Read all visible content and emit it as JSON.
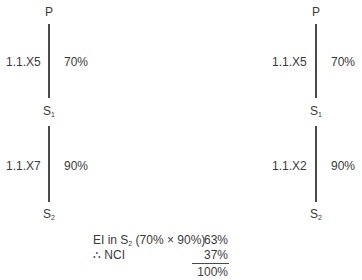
{
  "diagrams": [
    {
      "top_node": "P",
      "mid_node": "S",
      "mid_sub": "1",
      "bottom_node": "S",
      "bottom_sub": "2",
      "link1_ref": "1.1.X5",
      "link1_pct": "70%",
      "link2_ref": "1.1.X7",
      "link2_pct": "90%"
    },
    {
      "top_node": "P",
      "mid_node": "S",
      "mid_sub": "1",
      "bottom_node": "S",
      "bottom_sub": "2",
      "link1_ref": "1.1.X5",
      "link1_pct": "70%",
      "link2_ref": "1.1.X2",
      "link2_pct": "90%"
    }
  ],
  "calculation": {
    "row1_label_pre": "EI in S",
    "row1_label_sub": "2",
    "row1_label_post": " (70% × 90%)",
    "row1_value": "63%",
    "row2_label": "∴ NCI",
    "row2_value": "37%",
    "total_value": "100%"
  },
  "colors": {
    "text": "#3a3a3a",
    "line": "#4a4a4a"
  }
}
